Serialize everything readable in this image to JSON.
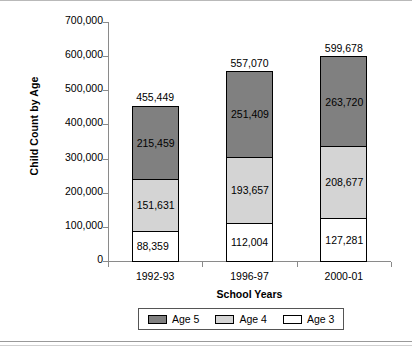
{
  "chart_data": {
    "type": "bar",
    "subtype": "stacked-bar",
    "title": "",
    "xlabel": "School Years",
    "ylabel": "Child Count by Age",
    "categories": [
      "1992-93",
      "1996-97",
      "2000-01"
    ],
    "series": [
      {
        "name": "Age 3",
        "color": "#ffffff",
        "values": [
          88359,
          112004,
          127281
        ],
        "value_labels": [
          "88,359",
          "112,004",
          "127,281"
        ]
      },
      {
        "name": "Age 4",
        "color": "#d4d4d4",
        "values": [
          151631,
          193657,
          208677
        ],
        "value_labels": [
          "151,631",
          "193,657",
          "208,677"
        ]
      },
      {
        "name": "Age 5",
        "color": "#808080",
        "values": [
          215459,
          251409,
          263720
        ],
        "value_labels": [
          "215,459",
          "251,409",
          "263,720"
        ]
      }
    ],
    "totals": [
      455449,
      557070,
      599678
    ],
    "total_labels": [
      "455,449",
      "557,070",
      "599,678"
    ],
    "ylim": [
      0,
      700000
    ],
    "ytick_values": [
      0,
      100000,
      200000,
      300000,
      400000,
      500000,
      600000,
      700000
    ],
    "ytick_labels": [
      "0",
      "100,000",
      "200,000",
      "300,000",
      "400,000",
      "500,000",
      "600,000",
      "700,000"
    ],
    "grid": false,
    "legend_position": "bottom",
    "legend_order": [
      "Age 5",
      "Age 4",
      "Age 3"
    ]
  },
  "axes": {
    "y_title": "Child Count by Age",
    "x_title": "School Years"
  },
  "legend": {
    "items": [
      {
        "label": "Age 5",
        "color": "#808080"
      },
      {
        "label": "Age 4",
        "color": "#d4d4d4"
      },
      {
        "label": "Age 3",
        "color": "#ffffff"
      }
    ]
  }
}
